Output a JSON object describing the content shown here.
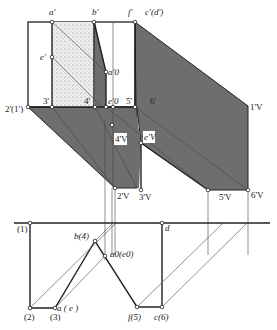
{
  "figure": {
    "type": "descriptive geometry shadow construction",
    "colors": {
      "shadow": "#6e6e6e",
      "stipple_face": "#e6e6e6",
      "line": "#222222",
      "background": "#ffffff"
    }
  },
  "front_view": {
    "labels": {
      "a": "a'",
      "b": "b'",
      "f": "f'",
      "cd": "c'(d')",
      "e": "e'",
      "a0": "a'0",
      "p21": "2'(1')",
      "p3": "3'",
      "p4": "4'",
      "e0": "e'0",
      "p5": "5'",
      "p6": "6'",
      "p1v": "1'V",
      "p4v": "4'V",
      "e_v": "e'V",
      "p2v": "2'V",
      "p3v": "3'V",
      "p5v": "5'V",
      "p6v": "6'V"
    }
  },
  "top_view": {
    "labels": {
      "p1": "(1)",
      "p2": "(2)",
      "p3": "(3)",
      "ae": "a ( e )",
      "b4": "b(4)",
      "a0e0": "a0(e0)",
      "d": "d",
      "f5": "f(5)",
      "c6": "c(6)"
    }
  }
}
